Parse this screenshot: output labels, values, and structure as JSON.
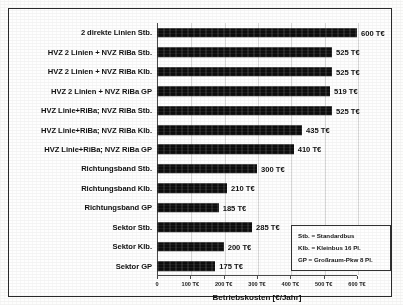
{
  "chart_data": {
    "type": "bar",
    "orientation": "horizontal",
    "title": "",
    "xlabel": "Betriebskosten [€/Jahr]",
    "ylabel": "",
    "xlim": [
      0,
      600
    ],
    "grid": true,
    "legend_position": "bottom-right-box",
    "tick_labels": [
      "0",
      "100 T€",
      "200 T€",
      "300 T€",
      "400 T€",
      "500 T€",
      "600 T€"
    ],
    "tick_values": [
      0,
      100,
      200,
      300,
      400,
      500,
      600
    ],
    "unit": "T€",
    "bar_color": "#0d0d0d",
    "categories": [
      "2 direkte Linien Stb.",
      "HVZ 2 Linien + NVZ RiBa Stb.",
      "HVZ 2 Linien + NVZ RiBa Klb.",
      "HVZ 2 Linien + NVZ RiBa GP",
      "HVZ Linie+RiBa; NVZ RiBa Stb.",
      "HVZ Linie+RiBa; NVZ RiBa Klb.",
      "HVZ Linie+RiBa; NVZ RiBa GP",
      "Richtungsband Stb.",
      "Richtungsband Klb.",
      "Richtungsband GP",
      "Sektor Stb.",
      "Sektor Klb.",
      "Sektor GP"
    ],
    "values": [
      600,
      525,
      525,
      519,
      525,
      435,
      410,
      300,
      210,
      185,
      285,
      200,
      175
    ],
    "value_labels": [
      "600 T€",
      "525 T€",
      "525 T€",
      "519 T€",
      "525 T€",
      "435 T€",
      "410 T€",
      "300 T€",
      "210 T€",
      "185 T€",
      "285 T€",
      "200 T€",
      "175 T€"
    ]
  },
  "legend": {
    "lines": [
      "Stb. = Standardbus",
      "Klb. = Kleinbus 16 Pl.",
      "GP = Großraum-Pkw 8 Pl."
    ]
  }
}
